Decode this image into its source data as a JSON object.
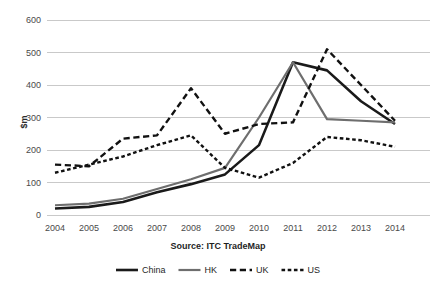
{
  "chart_data": {
    "type": "line",
    "title": "",
    "subtitle": "",
    "xlabel": "",
    "ylabel": "$m",
    "source_note": "Source: ITC TradeMap",
    "categories": [
      "2004",
      "2005",
      "2006",
      "2007",
      "2008",
      "2009",
      "2010",
      "2011",
      "2012",
      "2013",
      "2014"
    ],
    "x": [
      2004,
      2005,
      2006,
      2007,
      2008,
      2009,
      2010,
      2011,
      2012,
      2013,
      2014
    ],
    "ylim": [
      0,
      600
    ],
    "yticks": [
      0,
      100,
      200,
      300,
      400,
      500,
      600
    ],
    "grid": "horizontal",
    "legend_position": "bottom",
    "series": [
      {
        "name": "China",
        "style": "solid",
        "color": "#1a1a1a",
        "width": 2.6,
        "values": [
          20,
          25,
          40,
          70,
          95,
          125,
          215,
          470,
          445,
          350,
          280
        ]
      },
      {
        "name": "HK",
        "style": "solid",
        "color": "#6e6e6e",
        "width": 2.2,
        "values": [
          30,
          35,
          50,
          80,
          110,
          145,
          300,
          470,
          295,
          290,
          285
        ]
      },
      {
        "name": "UK",
        "style": "long-dash",
        "color": "#111111",
        "width": 2.4,
        "values": [
          155,
          150,
          235,
          245,
          390,
          250,
          280,
          285,
          510,
          400,
          290
        ]
      },
      {
        "name": "US",
        "style": "short-dash",
        "color": "#111111",
        "width": 2.4,
        "values": [
          130,
          155,
          180,
          215,
          245,
          145,
          115,
          160,
          240,
          230,
          210
        ]
      }
    ]
  },
  "legend": {
    "items": [
      {
        "label": "China",
        "swatch": "legend-swatch-solid-black"
      },
      {
        "label": "HK",
        "swatch": "legend-swatch-solid-gray"
      },
      {
        "label": "UK",
        "swatch": "legend-swatch-long-dash"
      },
      {
        "label": "US",
        "swatch": "legend-swatch-short-dash"
      }
    ]
  },
  "axis": {
    "y_title": "$m",
    "y_ticks": [
      "0",
      "100",
      "200",
      "300",
      "400",
      "500",
      "600"
    ],
    "x_ticks": [
      "2004",
      "2005",
      "2006",
      "2007",
      "2008",
      "2009",
      "2010",
      "2011",
      "2012",
      "2013",
      "2014"
    ]
  },
  "footer": {
    "source": "Source: ITC TradeMap"
  },
  "colors": {
    "china": "#1a1a1a",
    "hk": "#6e6e6e",
    "uk": "#111111",
    "us": "#111111",
    "gridline": "#c9c9c9",
    "background": "#ffffff",
    "text": "#3a3a3a"
  }
}
